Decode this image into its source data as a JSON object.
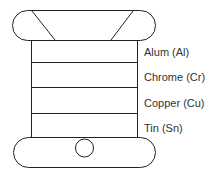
{
  "diagram": {
    "type": "layered-stack",
    "stroke_color": "#222222",
    "background": "#ffffff",
    "layers": [
      {
        "label": "Alum (Al)"
      },
      {
        "label": "Chrome (Cr)"
      },
      {
        "label": "Copper (Cu)"
      },
      {
        "label": "Tin (Sn)"
      }
    ]
  }
}
